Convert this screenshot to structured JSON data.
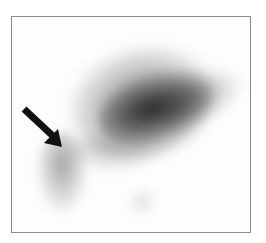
{
  "image": {
    "type": "grayscale scintigraphy scan",
    "frame_color": "#8a8a8a",
    "background": "#ffffff",
    "annotation": {
      "shape": "arrow",
      "direction": "down-right",
      "color": "#111111"
    }
  }
}
